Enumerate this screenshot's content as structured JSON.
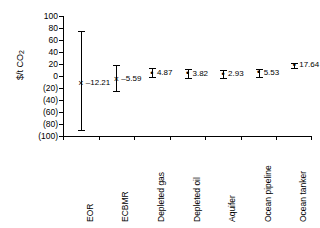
{
  "chart_data": {
    "type": "scatter",
    "title": "",
    "xlabel": "",
    "ylabel": "$/t CO2",
    "ylabel_base": "$/t CO",
    "ylabel_sub": "2",
    "ylim": [
      -100,
      100
    ],
    "ytick_values": [
      100,
      80,
      60,
      40,
      20,
      0,
      -20,
      -40,
      -60,
      -80,
      -100
    ],
    "ytick_labels": [
      "100",
      "80",
      "60",
      "40",
      "20",
      "0",
      "(20)",
      "(40)",
      "(60)",
      "(80)",
      "(100)"
    ],
    "grid": false,
    "legend": "none",
    "categories": [
      "EOR",
      "ECBMR",
      "Depleted gas",
      "Depleted oil",
      "Aquifer",
      "Ocean pipeline",
      "Ocean tanker"
    ],
    "values": [
      -12.21,
      -5.59,
      4.87,
      3.82,
      2.93,
      5.53,
      17.64
    ],
    "value_labels": [
      "–12.21",
      "–5.59",
      "4.87",
      "3.82",
      "2.93",
      "5.53",
      "17.64"
    ],
    "error_high": [
      75.0,
      18.0,
      14.0,
      11.0,
      10.0,
      12.0,
      21.0
    ],
    "error_low": [
      -90.0,
      -25.0,
      -2.0,
      -3.0,
      -4.0,
      -1.0,
      14.0
    ],
    "marker_symbols": [
      "×",
      "×",
      "•",
      "•",
      "•",
      "•",
      "•"
    ]
  }
}
